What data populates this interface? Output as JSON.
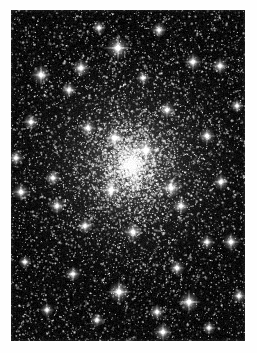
{
  "page": {
    "width": 257,
    "height": 353,
    "background_color": "#fefefe"
  },
  "image": {
    "name": "globular-cluster-photograph",
    "alt_text": "Dense globular star cluster on black sky background",
    "frame": {
      "x": 11,
      "y": 10,
      "width": 234,
      "height": 331
    },
    "sky_color": "#000000",
    "star_color": "#ffffff",
    "halo_color": "#9a9a9a"
  },
  "chart_data": {
    "type": "scatter",
    "xlabel": "",
    "ylabel": "",
    "xlim": [
      0,
      234
    ],
    "ylim": [
      0,
      331
    ],
    "grid": false,
    "legend": "none",
    "cluster_center": {
      "x": 120,
      "y": 155
    },
    "core_radius": 52,
    "halo_radius": 140,
    "background_star_count": 5200,
    "cluster_star_count": 6400,
    "bright_stars": [
      {
        "x": 107,
        "y": 38,
        "r": 3.4,
        "spike": 16
      },
      {
        "x": 70,
        "y": 58,
        "r": 2.6,
        "spike": 11
      },
      {
        "x": 30,
        "y": 65,
        "r": 2.8,
        "spike": 12
      },
      {
        "x": 182,
        "y": 52,
        "r": 2.5,
        "spike": 10
      },
      {
        "x": 209,
        "y": 56,
        "r": 2.4,
        "spike": 10
      },
      {
        "x": 148,
        "y": 20,
        "r": 2.2,
        "spike": 9
      },
      {
        "x": 88,
        "y": 18,
        "r": 2.0,
        "spike": 8
      },
      {
        "x": 20,
        "y": 112,
        "r": 2.3,
        "spike": 10
      },
      {
        "x": 58,
        "y": 80,
        "r": 2.2,
        "spike": 9
      },
      {
        "x": 77,
        "y": 118,
        "r": 2.4,
        "spike": 10
      },
      {
        "x": 104,
        "y": 128,
        "r": 3.0,
        "spike": 13
      },
      {
        "x": 135,
        "y": 140,
        "r": 3.2,
        "spike": 14
      },
      {
        "x": 100,
        "y": 180,
        "r": 3.0,
        "spike": 13
      },
      {
        "x": 160,
        "y": 178,
        "r": 2.9,
        "spike": 12
      },
      {
        "x": 156,
        "y": 100,
        "r": 2.4,
        "spike": 10
      },
      {
        "x": 196,
        "y": 126,
        "r": 2.4,
        "spike": 10
      },
      {
        "x": 5,
        "y": 148,
        "r": 2.2,
        "spike": 9
      },
      {
        "x": 10,
        "y": 182,
        "r": 2.5,
        "spike": 11
      },
      {
        "x": 42,
        "y": 168,
        "r": 2.2,
        "spike": 9
      },
      {
        "x": 46,
        "y": 196,
        "r": 2.3,
        "spike": 10
      },
      {
        "x": 170,
        "y": 196,
        "r": 2.4,
        "spike": 10
      },
      {
        "x": 122,
        "y": 222,
        "r": 2.7,
        "spike": 11
      },
      {
        "x": 74,
        "y": 216,
        "r": 2.3,
        "spike": 9
      },
      {
        "x": 210,
        "y": 172,
        "r": 2.3,
        "spike": 10
      },
      {
        "x": 220,
        "y": 232,
        "r": 2.5,
        "spike": 11
      },
      {
        "x": 166,
        "y": 258,
        "r": 2.3,
        "spike": 9
      },
      {
        "x": 62,
        "y": 264,
        "r": 2.2,
        "spike": 9
      },
      {
        "x": 108,
        "y": 282,
        "r": 3.1,
        "spike": 14
      },
      {
        "x": 178,
        "y": 292,
        "r": 3.0,
        "spike": 13
      },
      {
        "x": 146,
        "y": 302,
        "r": 2.2,
        "spike": 9
      },
      {
        "x": 86,
        "y": 310,
        "r": 2.0,
        "spike": 8
      },
      {
        "x": 152,
        "y": 322,
        "r": 2.6,
        "spike": 11
      },
      {
        "x": 118,
        "y": 336,
        "r": 2.3,
        "spike": 9
      },
      {
        "x": 36,
        "y": 300,
        "r": 2.0,
        "spike": 8
      },
      {
        "x": 198,
        "y": 318,
        "r": 2.0,
        "spike": 8
      },
      {
        "x": 228,
        "y": 286,
        "r": 2.1,
        "spike": 8
      },
      {
        "x": 14,
        "y": 252,
        "r": 1.9,
        "spike": 7
      },
      {
        "x": 226,
        "y": 96,
        "r": 2.0,
        "spike": 8
      },
      {
        "x": 196,
        "y": 232,
        "r": 2.1,
        "spike": 8
      },
      {
        "x": 132,
        "y": 68,
        "r": 2.0,
        "spike": 8
      }
    ]
  }
}
